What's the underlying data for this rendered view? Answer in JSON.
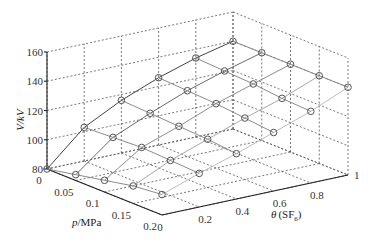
{
  "chart_data": {
    "type": "surface3d",
    "title": "",
    "xlabel": "p/MPa",
    "ylabel": "θ (SF6)",
    "zlabel": "V/kV",
    "x_ticks": [
      "0",
      "0.05",
      "0.1",
      "0.15",
      "0.2"
    ],
    "y_ticks": [
      "0",
      "0.2",
      "0.4",
      "0.6",
      "0.8",
      "1"
    ],
    "z_ticks": [
      "80",
      "100",
      "120",
      "140",
      "160"
    ],
    "xlim": [
      0,
      0.2
    ],
    "ylim": [
      0,
      1
    ],
    "zlim": [
      80,
      160
    ],
    "grid": true,
    "marker": "circle",
    "x": [
      0,
      0.05,
      0.1,
      0.15,
      0.2
    ],
    "y": [
      0,
      0.2,
      0.4,
      0.6,
      0.8,
      1
    ],
    "z": [
      [
        80,
        103,
        116,
        126,
        134,
        140
      ],
      [
        84,
        104,
        115,
        125,
        133,
        140
      ],
      [
        88,
        105,
        114,
        124,
        132,
        140
      ],
      [
        92,
        104,
        113,
        122,
        130,
        140
      ],
      [
        94,
        103,
        111,
        120,
        129,
        140
      ]
    ]
  },
  "labels": {
    "zlabel": "V/kV",
    "xlabel": "p/MPa",
    "ylabel_theta": "θ",
    "ylabel_rest": "(SF",
    "ylabel_sub": "6",
    "ylabel_close": ")"
  }
}
